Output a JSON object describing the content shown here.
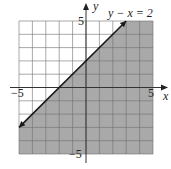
{
  "chart_data": {
    "type": "inequality-graph",
    "title": "",
    "equation_label": "y − x = 2",
    "boundary_line": {
      "equation": "y - x = 2",
      "slope": 1,
      "intercept": 2,
      "style": "solid",
      "arrows": "both",
      "from": [
        -5,
        -3
      ],
      "to": [
        3,
        5
      ]
    },
    "shaded_region": "below line (y - x ≤ 2)",
    "shade_color": "#a9a9a9",
    "xlabel": "x",
    "ylabel": "y",
    "xlim": [
      -5,
      5
    ],
    "ylim": [
      -5,
      5
    ],
    "grid": true,
    "grid_step": 1,
    "tick_labels": {
      "x_min": "−5",
      "x_max": "5",
      "y_min": "−5",
      "y_max": "5"
    }
  },
  "labels": {
    "equation": "y − x = 2",
    "x_axis": "x",
    "y_axis": "y",
    "x_min": "−5",
    "x_max": "5",
    "y_min": "−5",
    "y_max": "5"
  }
}
